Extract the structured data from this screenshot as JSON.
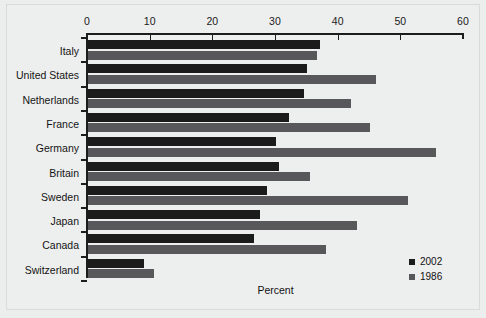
{
  "chart_data": {
    "type": "bar",
    "orientation": "horizontal",
    "title": "",
    "xlabel": "Percent",
    "ylabel": "",
    "xlim": [
      0,
      60
    ],
    "xticks": [
      0,
      10,
      20,
      30,
      40,
      50,
      60
    ],
    "grid": false,
    "legend_position": "bottom-right",
    "categories": [
      "Italy",
      "United States",
      "Netherlands",
      "France",
      "Germany",
      "Britain",
      "Sweden",
      "Japan",
      "Canada",
      "Switzerland"
    ],
    "series": [
      {
        "name": "2002",
        "color": "#1b1b1b",
        "values": [
          37.0,
          35.0,
          34.5,
          32.0,
          30.0,
          30.5,
          28.5,
          27.5,
          26.5,
          9.0
        ]
      },
      {
        "name": "1986",
        "color": "#58585a",
        "values": [
          36.5,
          46.0,
          42.0,
          45.0,
          55.5,
          35.5,
          51.0,
          43.0,
          38.0,
          10.5
        ]
      }
    ]
  },
  "axis": {
    "x_title": "Percent",
    "tick_labels": [
      "0",
      "10",
      "20",
      "30",
      "40",
      "50",
      "60"
    ]
  },
  "legend": {
    "items": [
      {
        "label": "2002",
        "color": "#1b1b1b"
      },
      {
        "label": "1986",
        "color": "#58585a"
      }
    ]
  }
}
